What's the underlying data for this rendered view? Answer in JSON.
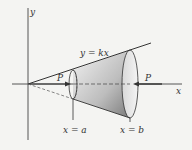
{
  "diagram": {
    "axes": {
      "x_label": "x",
      "y_label": "y"
    },
    "line_label": "y = kx",
    "force_labels": {
      "left": "P",
      "right": "P"
    },
    "boundaries": {
      "left": "x = a",
      "right": "x = b"
    },
    "colors": {
      "ink": "#333333",
      "background": "#f4f4f2",
      "shade_light": "#f0f0f0",
      "shade_dark": "#8a8a8a"
    }
  }
}
